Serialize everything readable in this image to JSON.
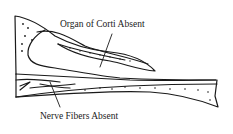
{
  "labels": {
    "organ_of_corti": "Organ of Corti Absent",
    "nerve_fibers": "Nerve Fibers Absent"
  },
  "colors": {
    "ink": "#1a1a1a",
    "background": "#ffffff"
  }
}
